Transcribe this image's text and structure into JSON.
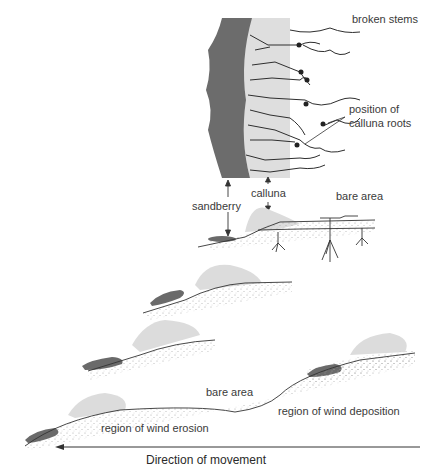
{
  "diagram": {
    "type": "sand dune / calluna colonisation schematic",
    "colors": {
      "sandberry": "#6e6e6e",
      "calluna": "#dcdcdc",
      "line": "#3a3a3a",
      "background": "#ffffff"
    },
    "labels": {
      "broken_stems": "broken stems",
      "position_of": "position of",
      "calluna_roots": "calluna roots",
      "calluna": "calluna",
      "bare_area_top": "bare area",
      "sandberry": "sandberry",
      "bare_area_bottom": "bare area",
      "wind_deposition": "region of wind deposition",
      "wind_erosion": "region of wind erosion",
      "direction": "Direction of movement"
    }
  }
}
